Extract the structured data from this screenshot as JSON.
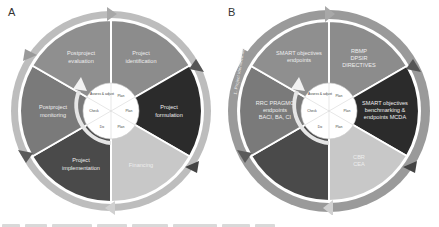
{
  "panels": [
    {
      "letter": "A",
      "segments": [
        {
          "label_line1": "Project",
          "label_line2": "identification",
          "label_line3": "",
          "color": "#8c8c8c"
        },
        {
          "label_line1": "Project",
          "label_line2": "formulation",
          "label_line3": "",
          "color": "#2b2b2b"
        },
        {
          "label_line1": "Financing",
          "label_line2": "",
          "label_line3": "",
          "color": "#c8c8c8"
        },
        {
          "label_line1": "Project",
          "label_line2": "implementation",
          "label_line3": "",
          "color": "#4a4a4a"
        },
        {
          "label_line1": "Postproject",
          "label_line2": "monitoring",
          "label_line3": "",
          "color": "#7a7a7a"
        },
        {
          "label_line1": "Postproject",
          "label_line2": "evaluation",
          "label_line3": "",
          "color": "#8f8f8f"
        }
      ],
      "hub": [
        "Plan",
        "Plan",
        "Plan",
        "Do",
        "Check",
        "Assess & adjust"
      ]
    },
    {
      "letter": "B",
      "segments": [
        {
          "label_line1": "RBMP",
          "label_line2": "DPSIR",
          "label_line3": "DIRECTIVES",
          "color": "#8c8c8c"
        },
        {
          "label_line1": "SMART objectives",
          "label_line2": "benchmarking &",
          "label_line3": "endpoints MCDA",
          "color": "#2b2b2b"
        },
        {
          "label_line1": "CBR",
          "label_line2": "CEA",
          "label_line3": "",
          "color": "#c8c8c8"
        },
        {
          "label_line1": "",
          "label_line2": "",
          "label_line3": "",
          "color": "#4a4a4a"
        },
        {
          "label_line1": "RRC PRAGMO",
          "label_line2": "endpoints",
          "label_line3": "BACI, BA, CI",
          "color": "#7a7a7a"
        },
        {
          "label_line1": "SMART objectives",
          "label_line2": "endpoints",
          "label_line3": "",
          "color": "#8f8f8f"
        }
      ],
      "hub": [
        "Plan",
        "Plan",
        "Plan",
        "Do",
        "Check",
        "Assess & adjust"
      ],
      "arc_labels": [
        "1. Project identification",
        "2. Project formulation",
        "3. Financing",
        "4. Project implementation",
        "5. Postproject monitoring",
        "6. Postproject evaluation"
      ]
    }
  ]
}
